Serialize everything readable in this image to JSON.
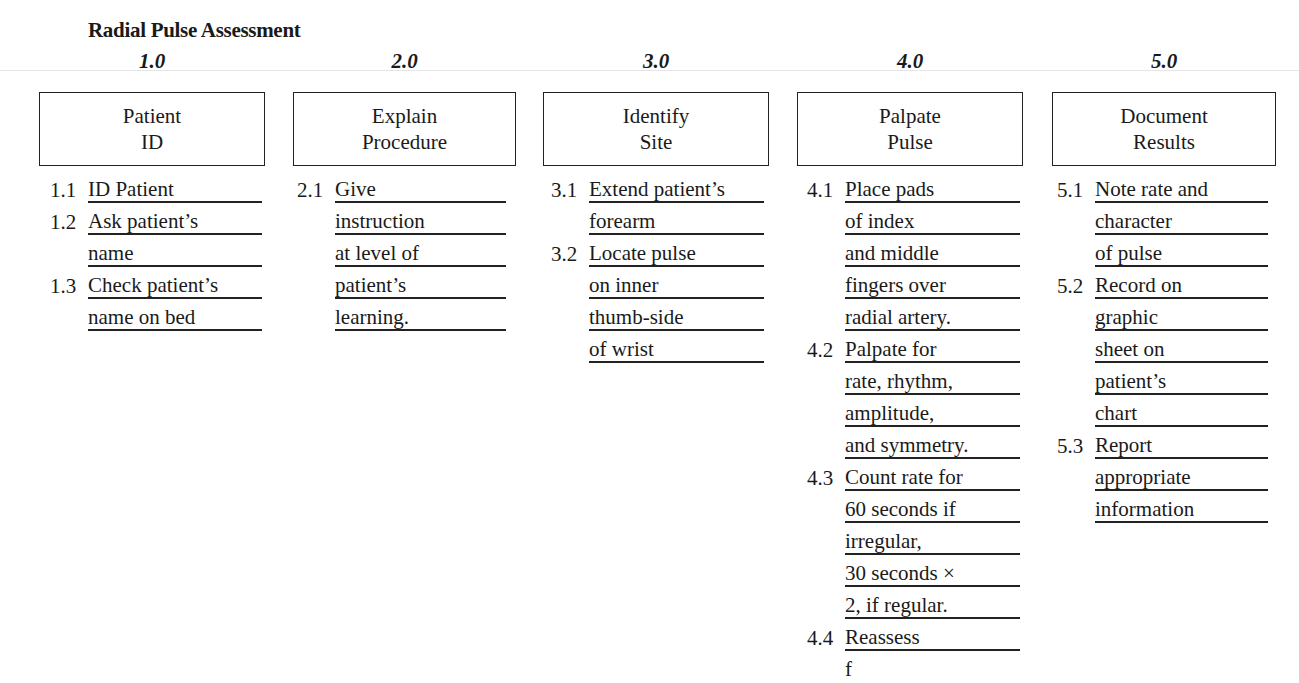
{
  "title": "Radial Pulse Assessment",
  "steps": [
    {
      "number": "1.0",
      "box_lines": [
        "Patient",
        "ID"
      ],
      "lines": [
        {
          "num": "1.1",
          "text": "ID Patient"
        },
        {
          "num": "1.2",
          "text": "Ask patient’s"
        },
        {
          "num": "",
          "text": "name"
        },
        {
          "num": "1.3",
          "text": "Check patient’s"
        },
        {
          "num": "",
          "text": "name on bed"
        }
      ]
    },
    {
      "number": "2.0",
      "box_lines": [
        "Explain",
        "Procedure"
      ],
      "lines": [
        {
          "num": "2.1",
          "text": "Give"
        },
        {
          "num": "",
          "text": "instruction"
        },
        {
          "num": "",
          "text": "at level of"
        },
        {
          "num": "",
          "text": "patient’s"
        },
        {
          "num": "",
          "text": "learning."
        }
      ]
    },
    {
      "number": "3.0",
      "box_lines": [
        "Identify",
        "Site"
      ],
      "lines": [
        {
          "num": "3.1",
          "text": "Extend patient’s"
        },
        {
          "num": "",
          "text": "forearm"
        },
        {
          "num": "3.2",
          "text": "Locate pulse"
        },
        {
          "num": "",
          "text": "on inner"
        },
        {
          "num": "",
          "text": "thumb-side"
        },
        {
          "num": "",
          "text": "of wrist"
        }
      ]
    },
    {
      "number": "4.0",
      "box_lines": [
        "Palpate",
        "Pulse"
      ],
      "lines": [
        {
          "num": "4.1",
          "text": "Place pads"
        },
        {
          "num": "",
          "text": "of index"
        },
        {
          "num": "",
          "text": "and middle"
        },
        {
          "num": "",
          "text": "fingers over"
        },
        {
          "num": "",
          "text": "radial artery."
        },
        {
          "num": "4.2",
          "text": "Palpate for"
        },
        {
          "num": "",
          "text": "rate, rhythm,"
        },
        {
          "num": "",
          "text": "amplitude,"
        },
        {
          "num": "",
          "text": "and symmetry."
        },
        {
          "num": "4.3",
          "text": "Count rate for"
        },
        {
          "num": "",
          "text": "60 seconds if"
        },
        {
          "num": "",
          "text": "irregular,"
        },
        {
          "num": "",
          "text": "30 seconds ×"
        },
        {
          "num": "",
          "text": "2, if regular."
        },
        {
          "num": "4.4",
          "text": "Reassess"
        },
        {
          "num": "",
          "text": "f"
        }
      ]
    },
    {
      "number": "5.0",
      "box_lines": [
        "Document",
        "Results"
      ],
      "lines": [
        {
          "num": "5.1",
          "text": "Note rate and"
        },
        {
          "num": "",
          "text": "character"
        },
        {
          "num": "",
          "text": "of pulse"
        },
        {
          "num": "5.2",
          "text": "Record on"
        },
        {
          "num": "",
          "text": "graphic"
        },
        {
          "num": "",
          "text": "sheet on"
        },
        {
          "num": "",
          "text": "patient’s"
        },
        {
          "num": "",
          "text": "chart"
        },
        {
          "num": "5.3",
          "text": "Report"
        },
        {
          "num": "",
          "text": "appropriate"
        },
        {
          "num": "",
          "text": "information"
        }
      ]
    }
  ]
}
